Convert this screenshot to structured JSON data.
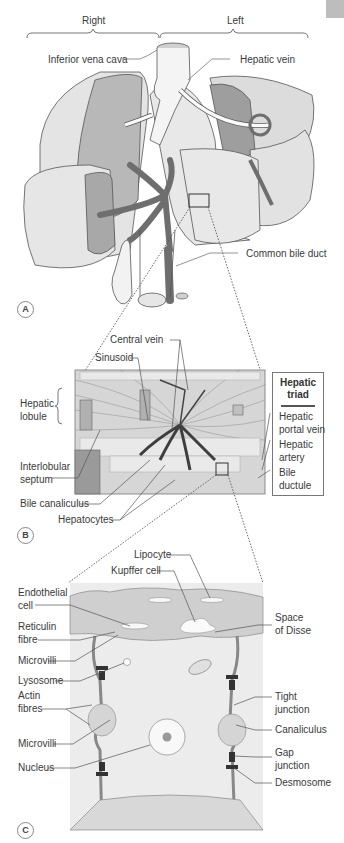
{
  "figure": {
    "panels": [
      {
        "id": "A",
        "labels": {
          "right": "Right",
          "left": "Left",
          "inferior_vena_cava": "Inferior vena cava",
          "hepatic_vein": "Hepatic vein",
          "common_bile_duct": "Common bile duct"
        }
      },
      {
        "id": "B",
        "labels": {
          "central_vein": "Central vein",
          "sinusoid": "Sinusoid",
          "hepatic_lobule_1": "Hepatic",
          "hepatic_lobule_2": "lobule",
          "interlobular_septum_1": "Interlobular",
          "interlobular_septum_2": "septum",
          "bile_canaliculus": "Bile canaliculus",
          "hepatocytes": "Hepatocytes"
        },
        "triad": {
          "title_1": "Hepatic",
          "title_2": "triad",
          "items": [
            {
              "line1": "Hepatic",
              "line2": "portal vein"
            },
            {
              "line1": "Hepatic",
              "line2": "artery"
            },
            {
              "line1": "Bile",
              "line2": "ductule"
            }
          ]
        }
      },
      {
        "id": "C",
        "labels": {
          "lipocyte": "Lipocyte",
          "kupffer_cell": "Kupffer cell",
          "endothelial_cell_1": "Endothelial",
          "endothelial_cell_2": "cell",
          "reticulin_fibre_1": "Reticulin",
          "reticulin_fibre_2": "fibre",
          "microvilli_top": "Microvilli",
          "lysosome": "Lysosome",
          "actin_fibres_1": "Actin",
          "actin_fibres_2": "fibres",
          "microvilli_bottom": "Microvilli",
          "nucleus": "Nucleus",
          "space_of_disse_1": "Space",
          "space_of_disse_2": "of Disse",
          "tight_junction_1": "Tight",
          "tight_junction_2": "junction",
          "canaliculus": "Canaliculus",
          "gap_junction_1": "Gap",
          "gap_junction_2": "junction",
          "desmosome": "Desmosome"
        }
      }
    ],
    "colors": {
      "lobe_light": "#e6e6e6",
      "lobe_mid": "#bdbdbd",
      "lobe_dark": "#9a9a9a",
      "vessel_dark": "#6e6e6e",
      "outline": "#555555",
      "cell_bg": "#ececec",
      "sinusoid_band": "#c9c9c9"
    }
  }
}
